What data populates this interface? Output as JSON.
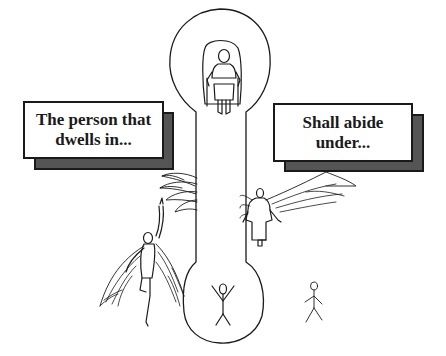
{
  "illustration": {
    "description": "Hand-drawn sketch: a figure seated on a throne inside a tall keyhole/capsule shape, with a stick figure at its base; two winged figures outside its sides and a small stick figure to the right.",
    "colors": {
      "ink": "#1a1a1a",
      "shadow": "#555555",
      "background": "#ffffff"
    }
  },
  "captions": {
    "left": {
      "line1": "The person that",
      "line2": "dwells in..."
    },
    "right": {
      "line1": "Shall abide",
      "line2": "under..."
    }
  },
  "figures": [
    {
      "name": "throne-figure",
      "label": "Seated figure on throne"
    },
    {
      "name": "inner-stick-figure",
      "label": "Stick figure with raised arms inside shape"
    },
    {
      "name": "left-winged-figure",
      "label": "Winged figure pointing upward"
    },
    {
      "name": "right-angel",
      "label": "Robed angel with spread wings"
    },
    {
      "name": "outer-stick-figure",
      "label": "Small stick figure outside"
    }
  ]
}
